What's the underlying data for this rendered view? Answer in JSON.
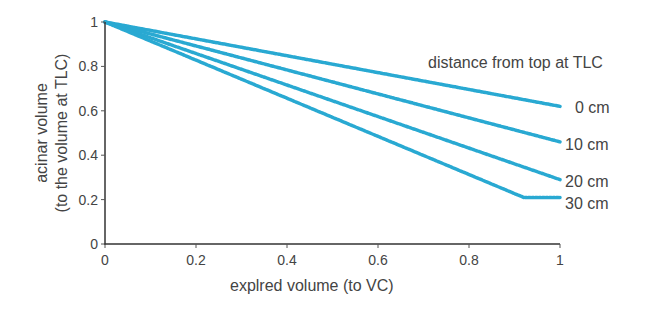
{
  "chart_data": {
    "type": "line",
    "title": "",
    "xlabel": "explred volume (to VC)",
    "ylabel_line1": "acinar volume",
    "ylabel_line2": "(to the volume at TLC)",
    "xlim": [
      0,
      1
    ],
    "ylim": [
      0,
      1
    ],
    "xticks": [
      "0",
      "0.2",
      "0.4",
      "0.6",
      "0.8",
      "1"
    ],
    "yticks": [
      "0",
      "0.2",
      "0.4",
      "0.6",
      "0.8",
      "1"
    ],
    "grid": false,
    "legend_title": "distance from top at TLC",
    "line_color": "#29a9d2",
    "series": [
      {
        "name": "0 cm",
        "x": [
          0,
          1
        ],
        "y": [
          1,
          0.62
        ]
      },
      {
        "name": "10 cm",
        "x": [
          0,
          1
        ],
        "y": [
          1,
          0.46
        ]
      },
      {
        "name": "20 cm",
        "x": [
          0,
          1
        ],
        "y": [
          1,
          0.29
        ]
      },
      {
        "name": "30 cm",
        "x": [
          0,
          0.92,
          1
        ],
        "y": [
          1,
          0.21,
          0.21
        ]
      }
    ]
  }
}
